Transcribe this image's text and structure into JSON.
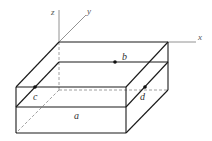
{
  "diagram": {
    "type": "3d-box-with-axes",
    "axes": {
      "x": "x",
      "y": "y",
      "z": "z"
    },
    "points": [
      {
        "id": "b",
        "label": "b"
      },
      {
        "id": "c",
        "label": "c"
      },
      {
        "id": "d",
        "label": "d"
      }
    ],
    "face_label": "a",
    "colors": {
      "edge": "#1a1a1a",
      "axis": "#777777",
      "hidden": "#888888"
    }
  }
}
